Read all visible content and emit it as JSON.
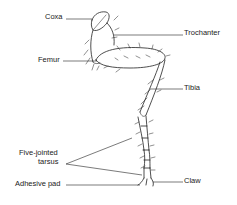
{
  "labels": {
    "coxa": "Coxa",
    "trochanter": "Trochanter",
    "femur": "Femur",
    "tibia": "Tibia",
    "tarsus_line1": "Five-jointed",
    "tarsus_line2": "tarsus",
    "adhesive_pad": "Adhesive pad",
    "claw": "Claw"
  },
  "colors": {
    "ink": "#222222",
    "background": "#ffffff"
  }
}
